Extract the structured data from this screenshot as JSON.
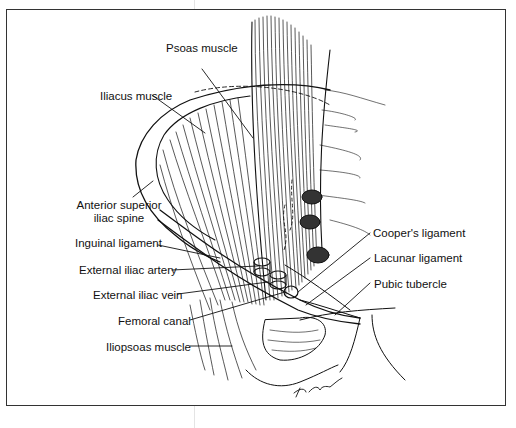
{
  "figure": {
    "type": "anatomical illustration",
    "signature": "D Cohn",
    "labels": {
      "psoas_muscle": "Psoas muscle",
      "iliacus_muscle": "Iliacus muscle",
      "anterior_superior_iliac_spine_line1": "Anterior superior",
      "anterior_superior_iliac_spine_line2": "iliac spine",
      "inguinal_ligament": "Inguinal ligament",
      "external_iliac_artery": "External iliac artery",
      "external_iliac_vein": "External iliac vein",
      "femoral_canal": "Femoral canal",
      "iliopsoas_muscle": "Iliopsoas muscle",
      "coopers_ligament": "Cooper's ligament",
      "lacunar_ligament": "Lacunar ligament",
      "pubic_tubercle": "Pubic tubercle"
    },
    "colors": {
      "ink": "#111111",
      "paper": "#ffffff",
      "frame": "#333333"
    }
  }
}
